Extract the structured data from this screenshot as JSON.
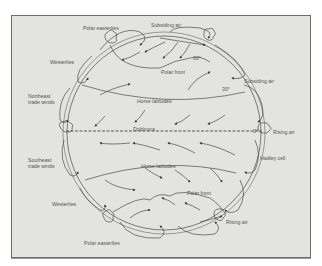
{
  "diagram": {
    "type": "global-atmospheric-circulation",
    "labels": {
      "polar_easterlies_top": "Polar easterlies",
      "subsiding_air_top": "Subsiding air",
      "westerlies_top": "Westerlies",
      "polar_front_top": "Polar front",
      "lat_60": "60°",
      "subsiding_air_right": "Subsiding air",
      "northeast_trade_winds": [
        "Northeast",
        "trade winds"
      ],
      "horse_latitudes_top": "Horse latitudes",
      "lat_30": "30°",
      "doldrums": "Doldrums",
      "lat_0": "0°",
      "rising_air_right": "Rising air",
      "southeast_trade_winds": [
        "Southeast",
        "trade winds"
      ],
      "hadley_cell": "Hadley cell",
      "horse_latitudes_bottom": "Horse latitudes",
      "polar_front_bottom": "Polar front",
      "westerlies_bottom": "Westerlies",
      "rising_air_bottom": "Rising air",
      "polar_easterlies_bottom": "Polar easterlies"
    },
    "colors": {
      "panel_fill": "#e3e3e0",
      "border": "#6d6d6b",
      "line": "#4a4a48",
      "text": "#555553"
    }
  }
}
